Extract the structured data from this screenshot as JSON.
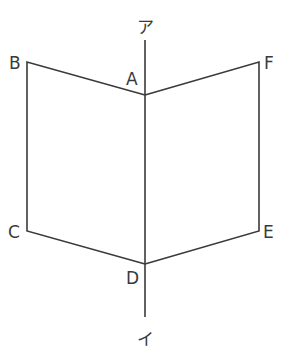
{
  "diagram": {
    "type": "folded-book-figure",
    "axis": {
      "top_label": "ア",
      "bottom_label": "イ"
    },
    "points": {
      "A": {
        "label": "A"
      },
      "B": {
        "label": "B"
      },
      "C": {
        "label": "C"
      },
      "D": {
        "label": "D"
      },
      "E": {
        "label": "E"
      },
      "F": {
        "label": "F"
      }
    },
    "faces": [
      {
        "name": "ABCD",
        "vertices": [
          "A",
          "B",
          "C",
          "D"
        ]
      },
      {
        "name": "AFED",
        "vertices": [
          "A",
          "F",
          "E",
          "D"
        ]
      }
    ],
    "colors": {
      "stroke": "#3a3a3a",
      "background": "#ffffff"
    }
  }
}
